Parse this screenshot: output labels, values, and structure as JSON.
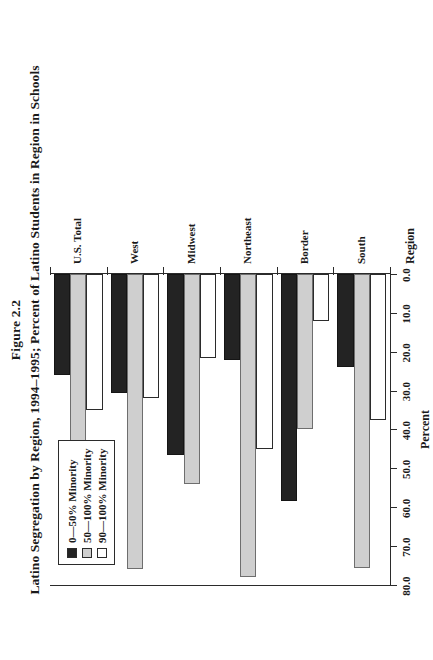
{
  "figure": {
    "number": "Figure 2.2",
    "title": "Latino Segregation by Region, 1994–1995; Percent of Latino Students in Region in Schools"
  },
  "legend": {
    "position": "top-left-inside",
    "entries": [
      {
        "label": "0—50% Minority",
        "color": "#232323",
        "key": "s0"
      },
      {
        "label": "50—100% Minority",
        "color": "#cfcfcf",
        "key": "s1"
      },
      {
        "label": "90—100% Minority",
        "color": "#ffffff",
        "key": "s2"
      }
    ]
  },
  "axes": {
    "value_axis_label": "Percent",
    "category_axis_label": "Region",
    "tick_labels": [
      "0.0",
      "10.0",
      "20.0",
      "30.0",
      "40.0",
      "50.0",
      "60.0",
      "70.0",
      "80.0"
    ]
  },
  "chart_data": {
    "type": "bar",
    "orientation": "horizontal",
    "title": "Latino Segregation by Region, 1994–1995; Percent of Latino Students in Region in Schools",
    "subtitle": "Figure 2.2",
    "xlabel": "Percent",
    "ylabel": "Region",
    "xlim": [
      0.0,
      80.0
    ],
    "xticks": [
      0.0,
      10.0,
      20.0,
      30.0,
      40.0,
      50.0,
      60.0,
      70.0,
      80.0
    ],
    "grid": false,
    "legend_position": "upper left",
    "categories": [
      "South",
      "Border",
      "Northeast",
      "Midwest",
      "West",
      "U.S. Total"
    ],
    "series": [
      {
        "name": "0—50% Minority",
        "color": "#232323",
        "values": [
          24.0,
          58.5,
          22.0,
          46.5,
          30.5,
          26.0
        ]
      },
      {
        "name": "50—100% Minority",
        "color": "#cfcfcf",
        "values": [
          75.5,
          40.0,
          78.0,
          54.0,
          76.0,
          74.5
        ]
      },
      {
        "name": "90—100% Minority",
        "color": "#ffffff",
        "values": [
          37.5,
          12.0,
          45.0,
          21.5,
          32.0,
          35.0
        ]
      }
    ]
  }
}
